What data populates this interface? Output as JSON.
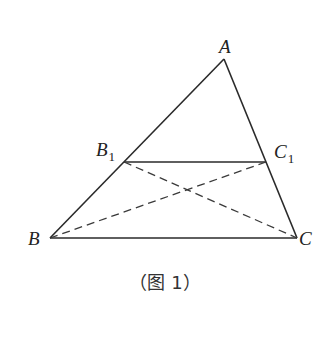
{
  "figure": {
    "caption": "（图 1）",
    "caption_open": "（",
    "caption_main": "图 1",
    "caption_close": "）",
    "points": {
      "A": {
        "label": "A",
        "subscript": "",
        "x": 224,
        "y": 59
      },
      "B": {
        "label": "B",
        "subscript": "",
        "x": 50,
        "y": 238
      },
      "C": {
        "label": "C",
        "subscript": "",
        "x": 297,
        "y": 238
      },
      "B1": {
        "label": "B",
        "subscript": "1",
        "x": 124,
        "y": 162
      },
      "C1": {
        "label": "C",
        "subscript": "1",
        "x": 266,
        "y": 162
      }
    },
    "segments_solid": [
      "AB",
      "AC",
      "BC",
      "B1C1"
    ],
    "segments_dashed": [
      "BC1",
      "B1C"
    ],
    "colors": {
      "line": "#2a2a2a",
      "text": "#222222",
      "background": "#ffffff"
    }
  }
}
